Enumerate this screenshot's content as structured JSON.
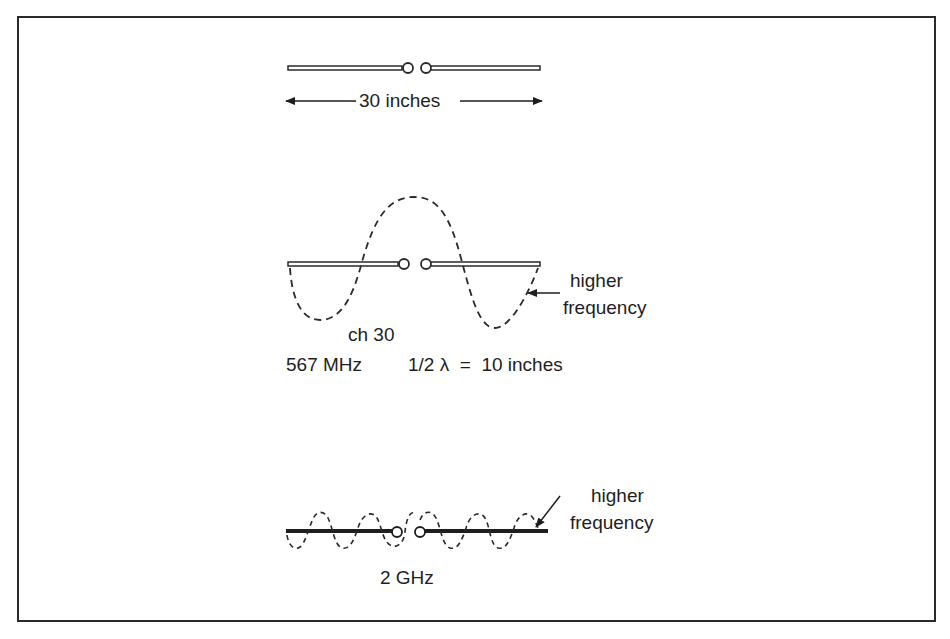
{
  "figure": {
    "antenna_top": {
      "dimension_label": "30 inches"
    },
    "antenna_middle": {
      "annotation": [
        "higher",
        "frequency"
      ],
      "channel_label": "ch 30",
      "frequency_label": "567 MHz",
      "wavelength_label": "1/2 λ  =  10 inches"
    },
    "antenna_bottom": {
      "annotation": [
        "higher",
        "frequency"
      ],
      "frequency_label": "2 GHz"
    },
    "colors": {
      "ink": "#1e1e1e",
      "background": "#ffffff"
    }
  }
}
